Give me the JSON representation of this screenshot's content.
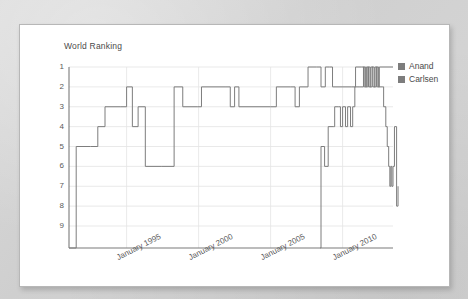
{
  "card": {
    "name": "chart-card"
  },
  "chart_data": {
    "type": "line",
    "title": "World Ranking",
    "xlabel": "",
    "ylabel": "World Ranking",
    "grid": true,
    "legend_position": "right",
    "y_inverted": true,
    "ylim": [
      1,
      9
    ],
    "y_ticks": [
      1,
      2,
      3,
      4,
      5,
      6,
      7,
      8,
      9
    ],
    "y_ticklabels": [
      "1",
      "2",
      "3",
      "4",
      "5",
      "6",
      "7",
      "8",
      "9"
    ],
    "xlim": [
      1991.0,
      2013.5
    ],
    "x_ticks": [
      1995,
      2000,
      2005,
      2010
    ],
    "x_ticklabels": [
      "January 1995",
      "January 2000",
      "January 2005",
      "January 2010"
    ],
    "colors": {
      "anand": "#7d7d7d",
      "carlsen": "#7d7d7d",
      "grid": "#e3e3e3",
      "axis": "#7a7a7a"
    },
    "series": [
      {
        "name": "Anand",
        "color": "#7d7d7d",
        "points": [
          [
            1991.0,
            10.0
          ],
          [
            1991.5,
            5.0
          ],
          [
            1992.5,
            5.0
          ],
          [
            1993.0,
            4.0
          ],
          [
            1993.5,
            3.0
          ],
          [
            1994.6,
            3.0
          ],
          [
            1995.0,
            2.0
          ],
          [
            1995.4,
            4.0
          ],
          [
            1995.8,
            3.0
          ],
          [
            1996.3,
            6.0
          ],
          [
            1997.4,
            6.0
          ],
          [
            1998.3,
            2.0
          ],
          [
            1998.9,
            3.0
          ],
          [
            1999.9,
            3.0
          ],
          [
            2000.2,
            2.0
          ],
          [
            2001.9,
            2.0
          ],
          [
            2002.2,
            3.0
          ],
          [
            2002.5,
            2.0
          ],
          [
            2002.8,
            3.0
          ],
          [
            2005.0,
            3.0
          ],
          [
            2005.4,
            2.0
          ],
          [
            2006.4,
            2.0
          ],
          [
            2006.7,
            3.0
          ],
          [
            2007.0,
            2.0
          ],
          [
            2007.6,
            1.0
          ],
          [
            2008.2,
            1.0
          ],
          [
            2008.5,
            2.0
          ],
          [
            2008.8,
            1.0
          ],
          [
            2009.1,
            1.0
          ],
          [
            2009.3,
            2.0
          ],
          [
            2010.6,
            2.0
          ],
          [
            2010.9,
            1.0
          ],
          [
            2011.3,
            1.0
          ],
          [
            2011.5,
            2.0
          ],
          [
            2011.65,
            1.0
          ],
          [
            2011.8,
            2.0
          ],
          [
            2011.95,
            1.0
          ],
          [
            2012.1,
            2.0
          ],
          [
            2012.25,
            1.0
          ],
          [
            2012.4,
            2.0
          ],
          [
            2012.55,
            1.0
          ],
          [
            2013.5,
            1.0
          ]
        ]
      },
      {
        "name": "Carlsen",
        "color": "#7d7d7d",
        "points": [
          [
            2008.45,
            10.0
          ],
          [
            2008.5,
            5.0
          ],
          [
            2008.75,
            6.0
          ],
          [
            2009.0,
            4.0
          ],
          [
            2009.35,
            4.0
          ],
          [
            2009.45,
            3.0
          ],
          [
            2009.7,
            3.0
          ],
          [
            2009.85,
            4.0
          ],
          [
            2010.0,
            3.0
          ],
          [
            2010.2,
            4.0
          ],
          [
            2010.35,
            3.0
          ],
          [
            2010.55,
            4.0
          ],
          [
            2010.7,
            3.0
          ],
          [
            2010.85,
            2.0
          ],
          [
            2011.2,
            2.0
          ],
          [
            2011.45,
            1.0
          ],
          [
            2011.6,
            2.0
          ],
          [
            2011.75,
            1.0
          ],
          [
            2011.9,
            2.0
          ],
          [
            2012.05,
            1.0
          ],
          [
            2012.2,
            2.0
          ],
          [
            2012.35,
            1.0
          ],
          [
            2012.5,
            2.0
          ],
          [
            2012.75,
            2.0
          ],
          [
            2012.85,
            3.0
          ],
          [
            2013.0,
            4.0
          ],
          [
            2013.1,
            5.0
          ],
          [
            2013.2,
            6.0
          ],
          [
            2013.28,
            7.0
          ],
          [
            2013.35,
            6.0
          ],
          [
            2013.42,
            7.0
          ],
          [
            2013.5,
            6.0
          ],
          [
            2013.6,
            4.0
          ],
          [
            2013.75,
            8.0
          ],
          [
            2013.85,
            7.0
          ]
        ]
      }
    ],
    "legend": [
      {
        "label": "Anand",
        "color": "#7d7d7d"
      },
      {
        "label": "Carlsen",
        "color": "#7d7d7d"
      }
    ]
  }
}
